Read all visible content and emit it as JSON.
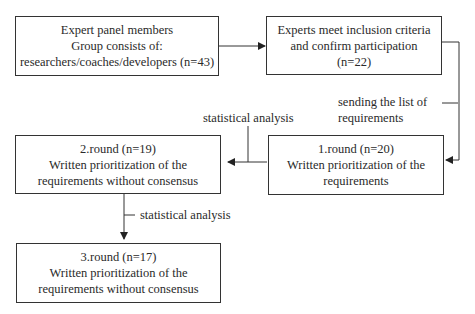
{
  "nodes": {
    "panel": {
      "lines": [
        "Expert panel members",
        "Group consists of:",
        "researchers/coaches/developers (n=43)"
      ]
    },
    "inclusion": {
      "lines": [
        "Experts meet inclusion criteria",
        "and confirm participation",
        "(n=22)"
      ]
    },
    "round1": {
      "lines": [
        "1.round (n=20)",
        "Written prioritization of the",
        "requirements"
      ]
    },
    "round2": {
      "lines": [
        "2.round (n=19)",
        "Written prioritization of the",
        "requirements without consensus"
      ]
    },
    "round3": {
      "lines": [
        "3.round (n=17)",
        "Written prioritization of the",
        "requirements without consensus"
      ]
    }
  },
  "edge_labels": {
    "sending": [
      "sending the list of",
      "requirements"
    ],
    "stat1": "statistical analysis",
    "stat2": "statistical analysis"
  },
  "colors": {
    "line": "#333333",
    "text": "#2a2a2a"
  }
}
